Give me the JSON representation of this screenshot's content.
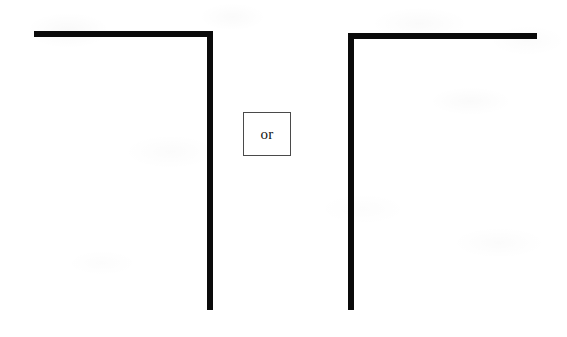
{
  "figure": {
    "background_color": "#ffffff",
    "stroke_color": "#0a0a0a",
    "canvas": {
      "width": 567,
      "height": 337
    },
    "connector": {
      "label": "or",
      "border_color": "#4a4a4a",
      "fill_color": "#ffffff",
      "x": 243,
      "y": 112,
      "width": 48,
      "height": 44
    },
    "shapes": [
      {
        "name": "left-shape",
        "description": "Top horizontal bar with vertical bar descending from its right end, forming a mirrored L",
        "orientation": "top-right-corner",
        "segments": [
          {
            "name": "left-top-bar",
            "type": "horizontal",
            "x": 34,
            "y": 31,
            "length": 179,
            "thickness": 6
          },
          {
            "name": "left-vert-bar",
            "type": "vertical",
            "x": 207,
            "y": 33,
            "length": 277,
            "thickness": 6
          }
        ]
      },
      {
        "name": "right-shape",
        "description": "Vertical bar on the left with top horizontal bar extending rightward, forming a gamma shape",
        "orientation": "top-left-corner",
        "segments": [
          {
            "name": "right-vert-bar",
            "type": "vertical",
            "x": 348,
            "y": 33,
            "length": 277,
            "thickness": 6
          },
          {
            "name": "right-top-bar",
            "type": "horizontal",
            "x": 348,
            "y": 33,
            "length": 189,
            "thickness": 6
          }
        ]
      }
    ]
  }
}
